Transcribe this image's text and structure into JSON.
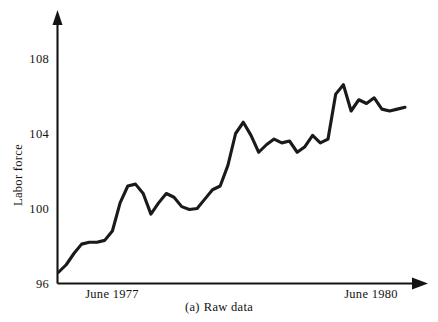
{
  "figure": {
    "caption_label": "(a)",
    "caption_text": "Raw data",
    "background_color": "#ffffff",
    "ink_color": "#1a1a1a"
  },
  "chart_data": {
    "type": "line",
    "title": "",
    "subtitle": "",
    "xlabel": "",
    "ylabel": "Labor force",
    "ylim": [
      96,
      109.6
    ],
    "xlim": [
      0,
      45
    ],
    "grid": false,
    "legend": null,
    "axis_style": "arrowed-L-frame",
    "y_ticks": [
      96,
      100,
      104,
      108
    ],
    "y_tick_labels": [
      "96",
      "100",
      "104",
      "108"
    ],
    "x_tick_labels": [
      "June 1977",
      "June 1980"
    ],
    "x_tick_positions": [
      5,
      41
    ],
    "series": [
      {
        "name": "Labor force",
        "color": "#1a1a1a",
        "x": [
          0,
          1,
          2,
          3,
          4,
          5,
          6,
          7,
          8,
          9,
          10,
          11,
          12,
          13,
          14,
          15,
          16,
          17,
          18,
          19,
          20,
          21,
          22,
          23,
          24,
          25,
          26,
          27,
          28,
          29,
          30,
          31,
          32,
          33,
          34,
          35,
          36,
          37,
          38,
          39,
          40,
          41,
          42,
          43,
          44,
          45
        ],
        "values": [
          96.6,
          97.0,
          97.6,
          98.1,
          98.2,
          98.2,
          98.3,
          98.8,
          100.3,
          101.2,
          101.3,
          100.8,
          99.7,
          100.3,
          100.8,
          100.6,
          100.1,
          99.95,
          100.0,
          100.5,
          101.0,
          101.2,
          102.3,
          104.0,
          104.6,
          103.9,
          103.0,
          103.4,
          103.7,
          103.5,
          103.6,
          103.0,
          103.3,
          103.9,
          103.5,
          103.7,
          106.1,
          106.6,
          105.2,
          105.8,
          105.6,
          105.9,
          105.3,
          105.2,
          105.3,
          105.4
        ]
      }
    ],
    "annotations": []
  },
  "axes": {
    "y_axis_name": "y-axis",
    "x_axis_name": "x-axis",
    "y_arrow": "up-arrow",
    "x_arrow": "right-arrow"
  }
}
